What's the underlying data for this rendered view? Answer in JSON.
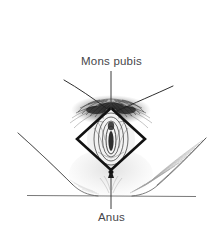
{
  "figure": {
    "type": "anatomical-line-diagram",
    "background_color": "#ffffff",
    "ink_color": "#2b2b2b",
    "label_color": "#46464a"
  },
  "labels": {
    "mons_pubis": "Mons pubis",
    "anus": "Anus"
  },
  "annotations": {
    "mons_pubis_leader": {
      "name": "leader-line-mons-pubis",
      "orientation": "vertical",
      "from_x": 111,
      "from_y": 71,
      "to_x": 111,
      "to_y": 112
    },
    "anus_leader": {
      "name": "leader-line-anus",
      "orientation": "vertical",
      "from_x": 111,
      "from_y": 208,
      "to_x": 111,
      "to_y": 170,
      "arrow": "up"
    }
  },
  "diamond": {
    "name": "perineal-diamond",
    "stroke_color": "#111111",
    "stroke_width": 2.6,
    "top_x": 111,
    "top_y": 108,
    "right_x": 145,
    "right_y": 139,
    "bottom_x": 111,
    "bottom_y": 170,
    "left_x": 77,
    "left_y": 139
  },
  "strokes": {
    "groin_crease_left": "from upper-left down-right to mons",
    "groin_crease_right": "from upper-right down-left to mons",
    "thigh_left": "long curve from upper-left sweeping to baseline",
    "thigh_right": "long curve from upper-right sweeping to baseline",
    "baseline": "horizontal rule across lower figure"
  },
  "shading": {
    "pubic_hair": "dense dark hatching above and around diamond apex",
    "labial_detail": "concentric oval contours within diamond",
    "perineal_shading": "light stipple below diamond toward baseline",
    "thigh_hatching_right": "fine diagonal hatch strokes on inner right thigh"
  }
}
